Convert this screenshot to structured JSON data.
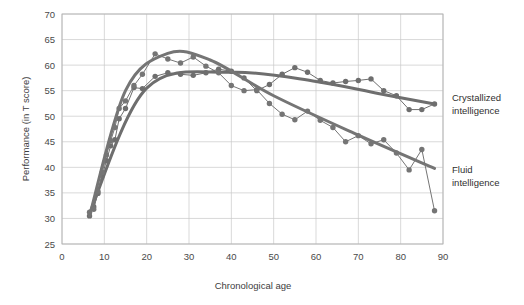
{
  "chart_data": {
    "type": "line",
    "title": "",
    "xlabel": "Chronological age",
    "ylabel": "Performance (in T score)",
    "xlim": [
      0,
      90
    ],
    "ylim": [
      25,
      70
    ],
    "xticks": [
      0,
      10,
      20,
      30,
      40,
      50,
      60,
      70,
      80,
      90
    ],
    "yticks": [
      25,
      30,
      35,
      40,
      45,
      50,
      55,
      60,
      65,
      70
    ],
    "grid": true,
    "legend_position": "right-outside",
    "colors": {
      "crystallized": "#6e6e6e",
      "fluid": "#757575",
      "grid": "#c9c9c9",
      "frame": "#b4b4b4",
      "text": "#3d3d3d"
    },
    "series": [
      {
        "name": "Crystallized intelligence",
        "label_line1": "Crystallized",
        "label_line2": "intelligence",
        "x": [
          6.5,
          7.5,
          8.5,
          9.5,
          10.5,
          11.5,
          12.5,
          13.5,
          15,
          17,
          19,
          22,
          25,
          28,
          31,
          34,
          37,
          40,
          43,
          46,
          49,
          52,
          55,
          58,
          61,
          64,
          67,
          70,
          73,
          76,
          79,
          82,
          85,
          88
        ],
        "y": [
          30.5,
          32.3,
          34.9,
          38.4,
          41.3,
          44.2,
          45.4,
          49.5,
          51.5,
          55.6,
          55.4,
          57.8,
          58.5,
          58.2,
          58.0,
          58.5,
          59.2,
          58.8,
          57.5,
          55.0,
          56.2,
          58.2,
          59.5,
          58.6,
          57.0,
          56.5,
          56.8,
          57.0,
          57.3,
          55.0,
          54.0,
          51.3,
          51.3,
          52.4
        ],
        "trend_x": [
          6.5,
          20,
          40,
          60,
          75,
          88
        ],
        "trend_y": [
          31.0,
          55.5,
          58.6,
          56.8,
          54.4,
          52.4
        ]
      },
      {
        "name": "Fluid intelligence",
        "label_line1": "Fluid",
        "label_line2": "intelligence",
        "x": [
          6.5,
          7.5,
          8.5,
          9.5,
          10.5,
          11.5,
          12.5,
          13.5,
          15,
          17,
          19,
          22,
          25,
          28,
          31,
          34,
          37,
          40,
          43,
          46,
          49,
          52,
          55,
          58,
          61,
          64,
          67,
          70,
          73,
          76,
          79,
          82,
          85,
          88
        ],
        "y": [
          31.2,
          31.8,
          35.3,
          39.0,
          42.4,
          45.2,
          47.8,
          51.5,
          53.0,
          56.0,
          58.2,
          62.2,
          61.2,
          60.4,
          61.6,
          59.8,
          58.5,
          56.0,
          55.0,
          55.2,
          52.5,
          50.4,
          49.3,
          51.0,
          49.2,
          47.8,
          45.0,
          46.2,
          44.6,
          45.4,
          42.8,
          39.5,
          43.5,
          31.5
        ],
        "trend_x": [
          6.5,
          15,
          25,
          35,
          50,
          70,
          88
        ],
        "trend_y": [
          30.5,
          55.0,
          62.3,
          61.0,
          54.0,
          46.3,
          39.8
        ]
      }
    ]
  }
}
